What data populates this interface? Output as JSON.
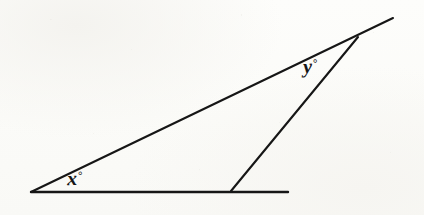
{
  "figure": {
    "kind": "geometry-diagram",
    "canvas": {
      "width": 424,
      "height": 215
    },
    "background_color": "#fcfcfa",
    "ink_color": "#161616",
    "stroke_width": 2
  },
  "labels": {
    "x_angle": {
      "variable": "x",
      "degree_symbol": "°",
      "text": "x°"
    },
    "y_angle": {
      "variable": "y",
      "degree_symbol": "°",
      "text": "y°"
    }
  },
  "geometry": {
    "points": {
      "left_vertex": {
        "x": 31,
        "y": 192
      },
      "base_right_end": {
        "x": 288,
        "y": 192
      },
      "base_intersection": {
        "x": 231,
        "y": 191
      },
      "apex": {
        "x": 358,
        "y": 37
      },
      "ray_tip": {
        "x": 393,
        "y": 18
      }
    },
    "segments": [
      {
        "name": "base-line",
        "from": "left_vertex",
        "to": "base_right_end"
      },
      {
        "name": "long-diagonal",
        "from": "left_vertex",
        "to": "ray_tip"
      },
      {
        "name": "slanted-line",
        "from": "base_intersection",
        "to": "apex"
      }
    ]
  },
  "chart_data": {
    "type": "diagram",
    "title": "",
    "annotations": [
      "x°",
      "y°"
    ]
  }
}
